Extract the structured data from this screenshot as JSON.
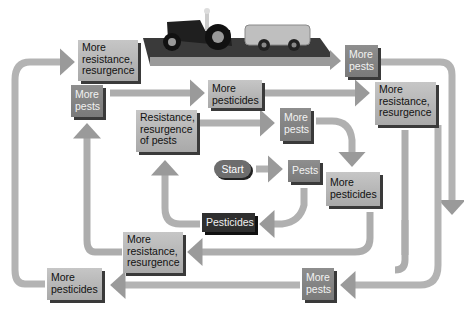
{
  "diagram": {
    "start": "Start",
    "inner_loop": {
      "pests": "Pests",
      "pesticides": "Pesticides",
      "resistance": [
        "Resistance,",
        "resurgence",
        "of pests"
      ]
    },
    "second_loop": {
      "more_pests": [
        "More",
        "pests"
      ],
      "more_pesticides": [
        "More",
        "pesticides"
      ],
      "more_resistance": [
        "More",
        "resistance,",
        "resurgence"
      ]
    },
    "third_loop": {
      "more_pests": [
        "More",
        "pests"
      ],
      "more_pesticides": [
        "More",
        "pesticides"
      ],
      "more_resistance": [
        "More",
        "resistance,",
        "resurgence"
      ]
    },
    "outer_loop": {
      "more_pests": [
        "More",
        "pests"
      ],
      "more_pesticides": [
        "More",
        "pesticides"
      ],
      "more_resistance": [
        "More",
        "resistance,",
        "resurgence"
      ]
    },
    "illustration": "tractor-with-spray-tank",
    "colors": {
      "arrow": "#b5b5b5",
      "box_light": "#b8b8b8",
      "box_mid": "#858585",
      "box_dark": "#2f2f2f",
      "shadow": "#3a3a3a"
    }
  }
}
